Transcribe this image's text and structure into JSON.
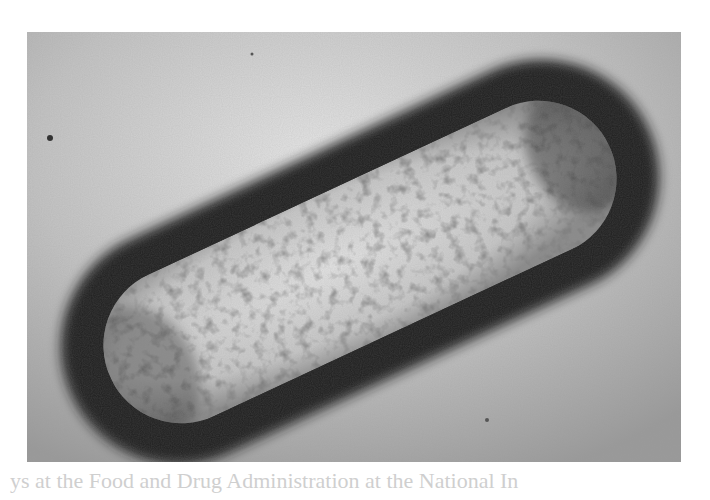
{
  "image": {
    "subject": "transmission electron micrograph of a rod-shaped bacterium with a dark capsule",
    "palette": {
      "background": "#b9b9b9",
      "highlight": "#e6e6e6",
      "capsule": "#1e1e1e",
      "interior": "#cfcfcf",
      "paper": "#ffffff"
    }
  },
  "bleed_text": {
    "bottom_line": "ys at the Food and Drug Administration at the National In"
  }
}
